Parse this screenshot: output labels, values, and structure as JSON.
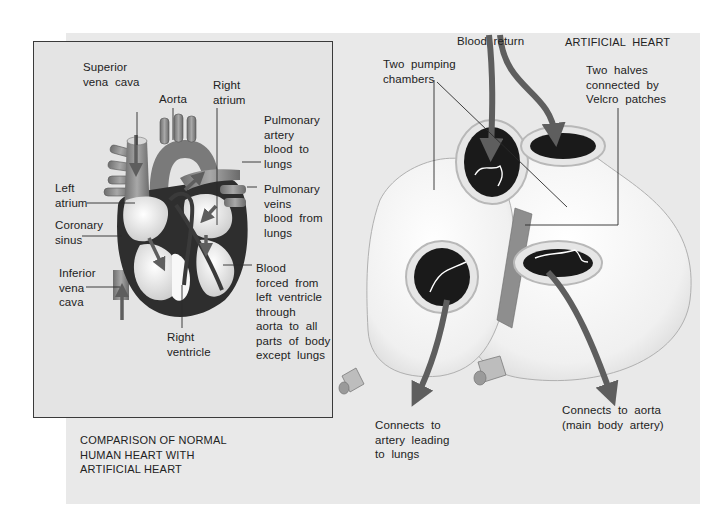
{
  "figure": {
    "left_panel": {
      "caption": "COMPARISON OF NORMAL\nHUMAN HEART WITH\nARTIFICIAL HEART",
      "labels": {
        "superior_vena_cava": "Superior\nvena  cava",
        "aorta": "Aorta",
        "right_atrium": "Right\natrium",
        "pulmonary_artery": "Pulmonary\nartery\nblood  to\nlungs",
        "left_atrium": "Left\natrium",
        "pulmonary_veins": "Pulmonary\nveins\nblood  from\nlungs",
        "coronary_sinus": "Coronary\nsinus",
        "inferior_vena_cava": "Inferior\nvena\ncava",
        "blood_forced": "Blood\nforced  from\nleft  ventricle\nthrough\naorta  to  all\nparts  of  body\nexcept  lungs",
        "right_ventricle": "Right\nventricle"
      }
    },
    "right_panel": {
      "title": "ARTIFICIAL  HEART",
      "labels": {
        "blood_return": "Blood  return",
        "two_pumping_chambers": "Two  pumping\nchambers",
        "two_halves": "Two  halves\nconnected  by\nVelcro  patches",
        "connects_artery_lungs": "Connects  to\nartery  leading\nto  lungs",
        "connects_aorta": "Connects  to  aorta\n(main  body  artery)"
      }
    },
    "colors": {
      "background": "#e9e9e9",
      "panel": "#e4e4e4",
      "arrow": "#5e5e5e",
      "heart_dark": "#2c2c2c",
      "heart_mid": "#8a8a8a",
      "heart_light": "#f2f2f2",
      "leader_line": "#2a2a2a"
    }
  }
}
